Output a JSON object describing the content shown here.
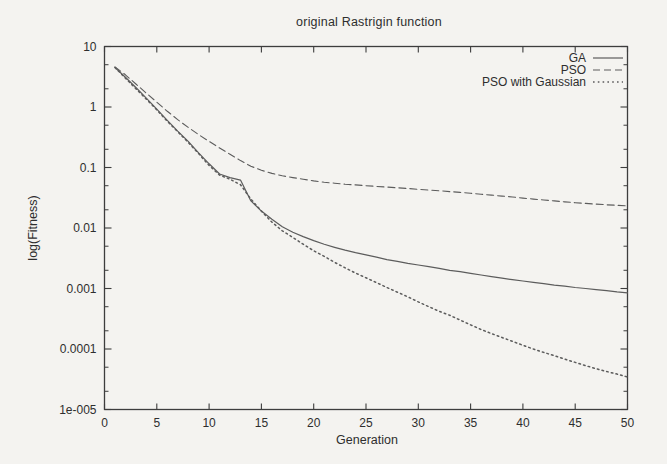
{
  "chart_data": {
    "type": "line",
    "title": "original Rastrigin function",
    "xlabel": "Generation",
    "ylabel": "log(Fitness)",
    "x_axis": {
      "min": 0,
      "max": 50,
      "tick_step": 5,
      "ticks": [
        0,
        5,
        10,
        15,
        20,
        25,
        30,
        35,
        40,
        45,
        50
      ]
    },
    "y_axis": {
      "scale": "log",
      "min": 1e-05,
      "max": 10,
      "tick_labels": [
        "10",
        "1",
        "0.1",
        "0.01",
        "0.001",
        "0.0001",
        "1e-005"
      ],
      "tick_values": [
        10,
        1,
        0.1,
        0.01,
        0.001,
        0.0001,
        1e-05
      ],
      "minor_tick_multipliers": [
        2,
        5
      ]
    },
    "grid": "off",
    "legend_position": "top-right-inside",
    "x": [
      1,
      2,
      3,
      4,
      5,
      6,
      7,
      8,
      9,
      10,
      11,
      12,
      13,
      14,
      15,
      16,
      17,
      18,
      19,
      20,
      21,
      22,
      23,
      24,
      25,
      26,
      27,
      28,
      29,
      30,
      31,
      32,
      33,
      34,
      35,
      36,
      37,
      38,
      39,
      40,
      41,
      42,
      43,
      44,
      45,
      46,
      47,
      48,
      49,
      50
    ],
    "series": [
      {
        "name": "GA",
        "line_style": "solid",
        "values": [
          4.5,
          3.1,
          2.1,
          1.4,
          0.92,
          0.6,
          0.4,
          0.27,
          0.175,
          0.115,
          0.078,
          0.068,
          0.062,
          0.028,
          0.019,
          0.014,
          0.0105,
          0.0085,
          0.0072,
          0.0062,
          0.0054,
          0.0048,
          0.0043,
          0.0039,
          0.0036,
          0.0033,
          0.003,
          0.0028,
          0.0026,
          0.00245,
          0.0023,
          0.00215,
          0.002,
          0.0019,
          0.00178,
          0.00167,
          0.00157,
          0.00148,
          0.0014,
          0.00133,
          0.00126,
          0.0012,
          0.00114,
          0.00109,
          0.00104,
          0.001,
          0.00096,
          0.00092,
          0.00088,
          0.00085
        ]
      },
      {
        "name": "PSO",
        "line_style": "dashed",
        "values": [
          4.6,
          3.4,
          2.4,
          1.7,
          1.2,
          0.85,
          0.62,
          0.46,
          0.35,
          0.27,
          0.21,
          0.165,
          0.13,
          0.105,
          0.09,
          0.08,
          0.073,
          0.068,
          0.064,
          0.06,
          0.057,
          0.055,
          0.053,
          0.0515,
          0.05,
          0.0487,
          0.0475,
          0.0462,
          0.045,
          0.0437,
          0.0425,
          0.0412,
          0.04,
          0.0387,
          0.0375,
          0.0362,
          0.035,
          0.0337,
          0.0325,
          0.0312,
          0.03,
          0.029,
          0.028,
          0.027,
          0.0262,
          0.0255,
          0.0248,
          0.0242,
          0.0237,
          0.0232
        ]
      },
      {
        "name": "PSO with Gaussian",
        "line_style": "dotted",
        "values": [
          4.5,
          3.0,
          2.0,
          1.35,
          0.9,
          0.58,
          0.39,
          0.26,
          0.17,
          0.108,
          0.075,
          0.064,
          0.052,
          0.03,
          0.019,
          0.0125,
          0.009,
          0.007,
          0.0054,
          0.0042,
          0.0034,
          0.0027,
          0.0022,
          0.0018,
          0.0015,
          0.00125,
          0.00104,
          0.00087,
          0.00073,
          0.0006,
          0.0005,
          0.00042,
          0.00036,
          0.0003,
          0.00025,
          0.00021,
          0.00018,
          0.000155,
          0.000134,
          0.000115,
          0.0001,
          8.8e-05,
          7.75e-05,
          6.8e-05,
          6e-05,
          5.3e-05,
          4.72e-05,
          4.25e-05,
          3.85e-05,
          3.45e-05
        ]
      }
    ],
    "colors": {
      "line": "#5c5c5c",
      "text": "#2e2e2e",
      "background": "#f4f3f0"
    }
  }
}
